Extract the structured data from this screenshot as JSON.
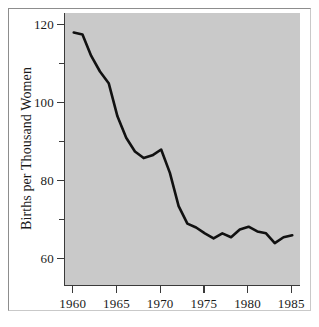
{
  "chart_data": {
    "type": "line",
    "title": "",
    "xlabel": "",
    "ylabel": "Births per Thousand Women",
    "xlim": [
      1959,
      1986
    ],
    "ylim": [
      53,
      123
    ],
    "grid": false,
    "legend": "none",
    "line_color": "#111111",
    "plot_background": "#c9c9c9",
    "frame_color": "#9a9a9a",
    "x_ticks": [
      {
        "value": 1960,
        "label": "1960"
      },
      {
        "value": 1965,
        "label": "1965"
      },
      {
        "value": 1970,
        "label": "1970"
      },
      {
        "value": 1975,
        "label": "1975"
      },
      {
        "value": 1980,
        "label": "1980"
      },
      {
        "value": 1985,
        "label": "1985"
      }
    ],
    "y_ticks": [
      {
        "value": 120,
        "label": "120",
        "minor": false
      },
      {
        "value": 110,
        "label": "",
        "minor": true
      },
      {
        "value": 100,
        "label": "100",
        "minor": false
      },
      {
        "value": 90,
        "label": "",
        "minor": true
      },
      {
        "value": 80,
        "label": "80",
        "minor": false
      },
      {
        "value": 70,
        "label": "",
        "minor": true
      },
      {
        "value": 60,
        "label": "60",
        "minor": false
      }
    ],
    "x": [
      1960,
      1961,
      1962,
      1963,
      1964,
      1965,
      1966,
      1967,
      1968,
      1969,
      1970,
      1971,
      1972,
      1973,
      1974,
      1975,
      1976,
      1977,
      1978,
      1979,
      1980,
      1981,
      1982,
      1983,
      1984,
      1985
    ],
    "values": [
      118,
      117.5,
      112,
      108,
      105,
      96.5,
      91,
      87.5,
      85.8,
      86.5,
      88,
      82,
      73.5,
      69,
      68,
      66.5,
      65.2,
      66.5,
      65.5,
      67.5,
      68.2,
      67,
      66.5,
      64,
      65.5,
      66
    ]
  }
}
